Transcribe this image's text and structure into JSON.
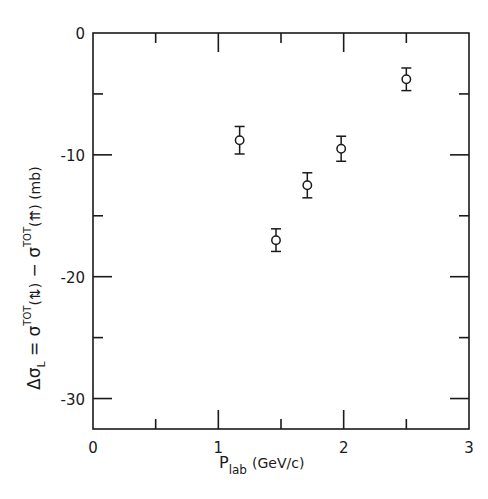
{
  "chart_data": {
    "type": "scatter",
    "title": "",
    "xlabel": "P_lab (GeV/c)",
    "xlabel_main": "P",
    "xlabel_sub": "lab",
    "xlabel_units": "(GeV/c)",
    "ylabel": "Δσ_L = σ^TOT(⇅) − σ^TOT(⇈) (mb)",
    "ylabel_parts": {
      "delta_sigma": "Δσ",
      "sub_L": "L",
      "equals": " = σ",
      "sup_tot_1": "TOT",
      "spin1": "(⇅)",
      "minus": " − σ",
      "sup_tot_2": "TOT",
      "spin2": "(⇈)",
      "units": " (mb)"
    },
    "xlim": [
      0,
      3
    ],
    "ylim": [
      -32.5,
      0
    ],
    "x_ticks": [
      0,
      1,
      2,
      3
    ],
    "x_tick_labels": [
      "0",
      "1",
      "2",
      "3"
    ],
    "x_minor_ticks": [
      0.5,
      1.5,
      2.5
    ],
    "y_ticks": [
      0,
      -10,
      -20,
      -30
    ],
    "y_tick_labels": [
      "0",
      "-10",
      "-20",
      "-30"
    ],
    "y_minor_ticks": [
      -5,
      -15,
      -25
    ],
    "grid": false,
    "legend": null,
    "marker": "open-circle",
    "series": [
      {
        "name": "Δσ_L",
        "points": [
          {
            "x": 1.17,
            "y": -8.8,
            "err": 0.8
          },
          {
            "x": 1.46,
            "y": -17.0,
            "err": 0.6
          },
          {
            "x": 1.71,
            "y": -12.5,
            "err": 0.7
          },
          {
            "x": 1.98,
            "y": -9.5,
            "err": 0.7
          },
          {
            "x": 2.5,
            "y": -3.8,
            "err": 0.6
          }
        ]
      }
    ]
  },
  "layout": {
    "plot_left": 93,
    "plot_right": 469,
    "plot_top": 33,
    "plot_bottom": 429
  }
}
